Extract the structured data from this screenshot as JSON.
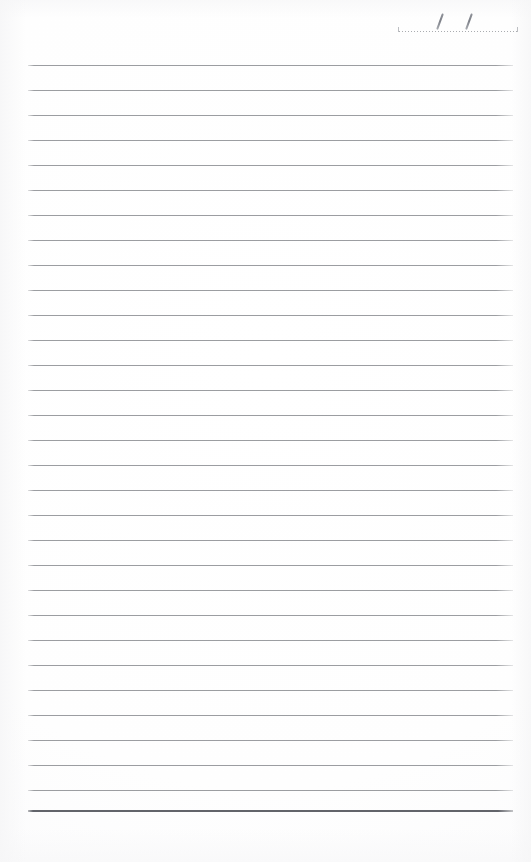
{
  "page": {
    "width": 531,
    "height": 862,
    "background_color": "#fefefe",
    "paper_edge_tint": "#f6f6f7"
  },
  "date_field": {
    "name": "date-line",
    "value": "",
    "placeholder": "",
    "separator_glyph": "/",
    "separators": [
      {
        "glyph": "/",
        "x": 43
      },
      {
        "glyph": "/",
        "x": 72
      }
    ],
    "rule_style": "dotted",
    "rule_color": "#aaacb0",
    "rule_left": 396,
    "rule_top": 31,
    "rule_width": 124
  },
  "ruling": {
    "line_color": "#96989c",
    "bottom_line_color": "#62646a",
    "left_margin": 28,
    "right_margin": 18,
    "line_width": 485,
    "first_line_y": 65,
    "line_spacing": 25,
    "line_count": 30,
    "bottom_rule_y": 810,
    "bottom_rule_thickness": 2,
    "lines": [
      {
        "index": 1,
        "y": 65,
        "weight": "thin"
      },
      {
        "index": 2,
        "y": 90,
        "weight": "thin"
      },
      {
        "index": 3,
        "y": 115,
        "weight": "thin"
      },
      {
        "index": 4,
        "y": 140,
        "weight": "thin"
      },
      {
        "index": 5,
        "y": 165,
        "weight": "thin"
      },
      {
        "index": 6,
        "y": 190,
        "weight": "thin"
      },
      {
        "index": 7,
        "y": 215,
        "weight": "thin"
      },
      {
        "index": 8,
        "y": 240,
        "weight": "thin"
      },
      {
        "index": 9,
        "y": 265,
        "weight": "thin"
      },
      {
        "index": 10,
        "y": 290,
        "weight": "thin"
      },
      {
        "index": 11,
        "y": 315,
        "weight": "thin"
      },
      {
        "index": 12,
        "y": 340,
        "weight": "thin"
      },
      {
        "index": 13,
        "y": 365,
        "weight": "thin"
      },
      {
        "index": 14,
        "y": 390,
        "weight": "thin"
      },
      {
        "index": 15,
        "y": 415,
        "weight": "thin"
      },
      {
        "index": 16,
        "y": 440,
        "weight": "thin"
      },
      {
        "index": 17,
        "y": 465,
        "weight": "thin"
      },
      {
        "index": 18,
        "y": 490,
        "weight": "thin"
      },
      {
        "index": 19,
        "y": 515,
        "weight": "thin"
      },
      {
        "index": 20,
        "y": 540,
        "weight": "thin"
      },
      {
        "index": 21,
        "y": 565,
        "weight": "thin"
      },
      {
        "index": 22,
        "y": 590,
        "weight": "thin"
      },
      {
        "index": 23,
        "y": 615,
        "weight": "thin"
      },
      {
        "index": 24,
        "y": 640,
        "weight": "thin"
      },
      {
        "index": 25,
        "y": 665,
        "weight": "thin"
      },
      {
        "index": 26,
        "y": 690,
        "weight": "thin"
      },
      {
        "index": 27,
        "y": 715,
        "weight": "thin"
      },
      {
        "index": 28,
        "y": 740,
        "weight": "thin"
      },
      {
        "index": 29,
        "y": 765,
        "weight": "thin"
      },
      {
        "index": 30,
        "y": 790,
        "weight": "thin"
      },
      {
        "index": 31,
        "y": 810,
        "weight": "thick"
      }
    ]
  },
  "content": {
    "body_text": "",
    "is_blank": true
  }
}
